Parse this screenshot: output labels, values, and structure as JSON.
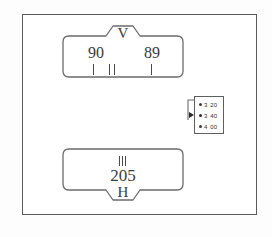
{
  "diagram": {
    "vertical_panel": {
      "notch_letter": "V",
      "value_left": "90",
      "value_right": "89",
      "tick_marks": 4
    },
    "horizontal_panel": {
      "notch_letter": "H",
      "value": "205",
      "tick_marks": 3
    },
    "option_list": {
      "options": [
        {
          "major": "3",
          "minor": "20",
          "selected": false
        },
        {
          "major": "3",
          "minor": "40",
          "selected": true
        },
        {
          "major": "4",
          "minor": "00",
          "selected": false
        }
      ]
    },
    "colors": {
      "frame_stroke": "#5a5a5a",
      "panel_stroke": "#6b6b6b",
      "text": "#3a3a3a",
      "background": "#ffffff"
    }
  }
}
